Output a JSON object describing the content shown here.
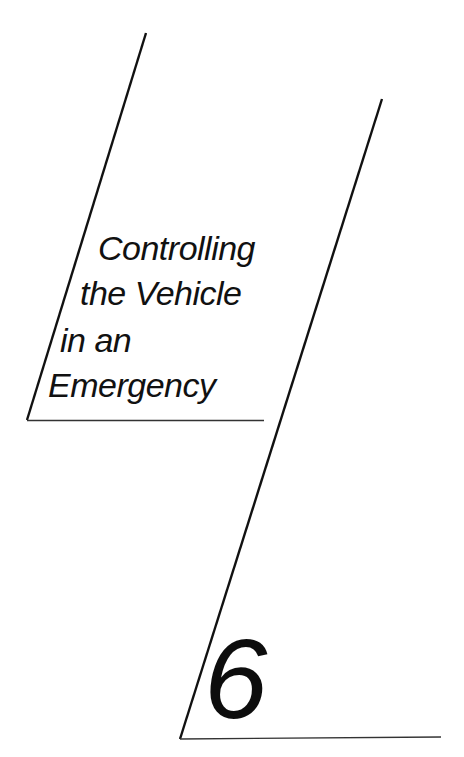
{
  "chapter": {
    "title_lines": [
      "Controlling",
      "the Vehicle",
      "in an",
      "Emergency"
    ],
    "title": "Controlling the Vehicle in an Emergency",
    "number": "6"
  },
  "colors": {
    "background": "#ffffff",
    "ink": "#111111"
  }
}
